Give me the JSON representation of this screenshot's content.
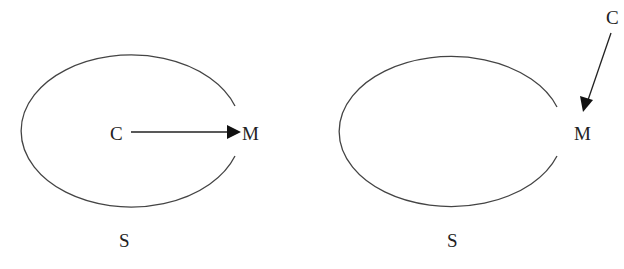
{
  "diagram": {
    "panels": [
      {
        "id": "left",
        "boundary_label": "S",
        "source_label": "C",
        "target_label": "M",
        "source_position": "inside",
        "arrow": {
          "from": "C",
          "to": "M",
          "direction": "horizontal"
        }
      },
      {
        "id": "right",
        "boundary_label": "S",
        "source_label": "C",
        "target_label": "M",
        "source_position": "outside",
        "arrow": {
          "from": "C",
          "to": "M",
          "direction": "diagonal-down-left"
        }
      }
    ],
    "colors": {
      "stroke": "#444444",
      "text": "#222222",
      "background": "#ffffff"
    }
  }
}
